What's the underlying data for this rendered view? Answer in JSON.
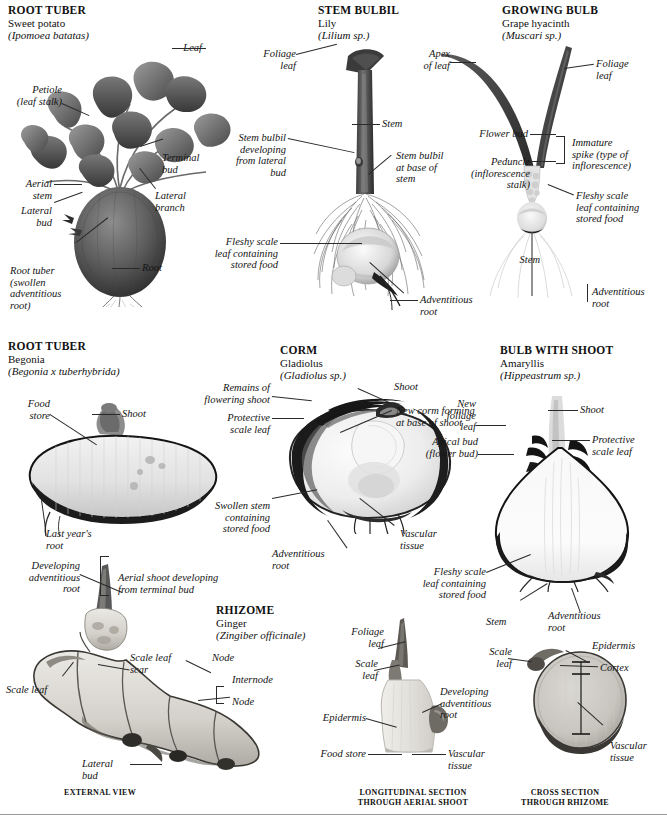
{
  "page": {
    "background": "#ffffff",
    "ink": "#141414"
  },
  "panels": [
    {
      "id": "root-tuber-sweet-potato",
      "caption": "ROOT TUBER",
      "common_name": "Sweet potato",
      "latin_name": "(Ipomoea batatas)",
      "labels": [
        "Leaf",
        "Petiole\n(leaf stalk)",
        "Aerial\nstem",
        "Lateral\nbud",
        "Terminal\nbud",
        "Lateral\nbranch",
        "Root tuber\n(swollen\nadventitious\nroot)",
        "Root"
      ]
    },
    {
      "id": "stem-bulbil-lily",
      "caption": "STEM BULBIL",
      "common_name": "Lily",
      "latin_name": "(Lilium sp.)",
      "labels": [
        "Foliage\nleaf",
        "Stem",
        "Stem bulbil\ndeveloping\nfrom lateral\nbud",
        "Stem bulbil\nat base of\nstem",
        "Fleshy scale\nleaf containing\nstored food",
        "Adventitious\nroot"
      ]
    },
    {
      "id": "growing-bulb-grape-hyacinth",
      "caption": "GROWING BULB",
      "common_name": "Grape hyacinth",
      "latin_name": "(Muscari sp.)",
      "labels": [
        "Apex\nof leaf",
        "Foliage\nleaf",
        "Flower bud",
        "Immature\nspike (type of\ninflorescence)",
        "Peduncle\n(inflorescence\nstalk)",
        "Fleshy scale\nleaf containing\nstored food",
        "Stem",
        "Adventitious\nroot"
      ]
    },
    {
      "id": "root-tuber-begonia",
      "caption": "ROOT TUBER",
      "common_name": "Begonia",
      "latin_name": "(Begonia x tuberhybrida)",
      "labels": [
        "Food\nstore",
        "Shoot",
        "Last year's\nroot"
      ]
    },
    {
      "id": "corm-gladiolus",
      "caption": "CORM",
      "common_name": "Gladiolus",
      "latin_name": "(Gladiolus sp.)",
      "labels": [
        "Remains of\nflowering shoot",
        "Protective\nscale leaf",
        "Shoot",
        "New corm forming\nat base of shoot",
        "Swollen stem\ncontaining\nstored food",
        "Vascular\ntissue",
        "Adventitious\nroot"
      ]
    },
    {
      "id": "bulb-with-shoot-amaryllis",
      "caption": "BULB WITH SHOOT",
      "common_name": "Amaryllis",
      "latin_name": "(Hippeastrum sp.)",
      "labels": [
        "New\nfoliage\nleaf",
        "Shoot",
        "Apical bud\n(flower bud)",
        "Protective\nscale leaf",
        "Fleshy scale\nleaf containing\nstored food",
        "Stem",
        "Adventitious\nroot"
      ]
    },
    {
      "id": "rhizome-ginger",
      "caption": "RHIZOME",
      "common_name": "Ginger",
      "latin_name": "(Zingiber officinale)",
      "labels": [
        "Developing\nadventitious\nroot",
        "Aerial shoot developing\nfrom terminal bud",
        "Scale leaf\nscar",
        "Scale leaf",
        "Node",
        "Internode",
        "Node",
        "Lateral bud",
        "Foliage\nleaf",
        "Scale\nleaf",
        "Developing\nadventitious\nroot",
        "Epidermis",
        "Food store",
        "Vascular\ntissue",
        "Epidermis",
        "Cortex",
        "Vascular\ntissue"
      ]
    }
  ],
  "labels": {
    "leaf": "Leaf",
    "petiole": "Petiole\n(leaf stalk)",
    "aerial_stem": "Aerial\nstem",
    "lateral_bud": "Lateral\nbud",
    "terminal_bud": "Terminal\nbud",
    "lateral_branch": "Lateral\nbranch",
    "root_tuber_swollen": "Root tuber\n(swollen\nadventitious\nroot)",
    "root": "Root",
    "foliage_leaf": "Foliage\nleaf",
    "stem": "Stem",
    "stem_bulbil_developing": "Stem bulbil\ndeveloping\nfrom lateral\nbud",
    "stem_bulbil_base": "Stem bulbil\nat base of\nstem",
    "fleshy_scale_leaf": "Fleshy scale\nleaf containing\nstored food",
    "adventitious_root": "Adventitious\nroot",
    "apex_of_leaf": "Apex\nof leaf",
    "flower_bud": "Flower bud",
    "immature_spike": "Immature\nspike (type of\ninflorescence)",
    "peduncle": "Peduncle\n(inflorescence\nstalk)",
    "food_store_2l": "Food\nstore",
    "shoot": "Shoot",
    "last_years_root": "Last year's\nroot",
    "remains_flowering_shoot": "Remains of\nflowering shoot",
    "protective_scale_leaf": "Protective\nscale leaf",
    "new_corm_forming": "New corm forming\nat base of shoot",
    "swollen_stem": "Swollen stem\ncontaining\nstored food",
    "vascular_tissue": "Vascular\ntissue",
    "new_foliage_leaf": "New\nfoliage\nleaf",
    "apical_bud": "Apical bud\n(flower bud)",
    "developing_adventitious_root": "Developing\nadventitious\nroot",
    "aerial_shoot_developing": "Aerial shoot developing\nfrom terminal bud",
    "scale_leaf_scar": "Scale leaf\nscar",
    "scale_leaf": "Scale leaf",
    "node": "Node",
    "internode": "Internode",
    "scale_leaf_2l": "Scale\nleaf",
    "epidermis": "Epidermis",
    "food_store": "Food store",
    "cortex": "Cortex"
  },
  "section_captions": {
    "external_view": "EXTERNAL VIEW",
    "longitudinal": "LONGITUDINAL SECTION\nTHROUGH AERIAL SHOOT",
    "cross_section": "CROSS SECTION\nTHROUGH RHIZOME"
  }
}
